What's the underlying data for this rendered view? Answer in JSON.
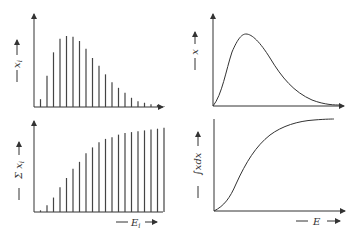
{
  "panels": {
    "top_left": {
      "ylabel": "x",
      "ylabel_sub": "i",
      "type": "discrete"
    },
    "bottom_left": {
      "ylabel": "Σ x",
      "ylabel_sub": "i",
      "xlabel": "E",
      "xlabel_sub": "i",
      "type": "discrete-cumulative"
    },
    "top_right": {
      "ylabel": "x",
      "type": "continuous"
    },
    "bottom_right": {
      "ylabel": "∫xdx",
      "xlabel": "E",
      "type": "continuous-cumulative"
    }
  },
  "chart_data": [
    {
      "type": "bar",
      "title": "",
      "ylabel": "x_i",
      "xlabel": "E_i",
      "categories": [
        1,
        2,
        3,
        4,
        5,
        6,
        7,
        8,
        9,
        10,
        11,
        12,
        13,
        14,
        15,
        16,
        17,
        18,
        19,
        20
      ],
      "values": [
        11,
        44,
        77,
        96,
        100,
        99,
        93,
        82,
        69,
        58,
        46,
        35,
        27,
        20,
        13,
        8,
        6,
        4,
        3,
        1
      ],
      "axes": "arrows, no ticks"
    },
    {
      "type": "bar",
      "title": "",
      "ylabel": "Σ x_i",
      "xlabel": "E_i",
      "categories": [
        1,
        2,
        3,
        4,
        5,
        6,
        7,
        8,
        9,
        10,
        11,
        12,
        13,
        14,
        15,
        16,
        17,
        18,
        19,
        20
      ],
      "values": [
        2,
        8,
        17,
        29,
        40,
        51,
        59,
        69,
        76,
        82,
        86,
        88,
        91,
        93,
        94,
        95,
        96,
        97,
        98,
        99
      ],
      "axes": "arrows, no ticks"
    },
    {
      "type": "line",
      "title": "",
      "ylabel": "x",
      "xlabel": "E",
      "x": [
        0,
        0.05,
        0.1,
        0.15,
        0.2,
        0.25,
        0.3,
        0.4,
        0.5,
        0.6,
        0.7,
        0.8,
        0.9,
        1.0
      ],
      "y": [
        0,
        35,
        75,
        96,
        100,
        95,
        85,
        62,
        40,
        24,
        13,
        6,
        3,
        1
      ],
      "axes": "arrows, no ticks"
    },
    {
      "type": "line",
      "title": "",
      "ylabel": "∫xdx",
      "xlabel": "E",
      "x": [
        0,
        0.1,
        0.2,
        0.3,
        0.4,
        0.5,
        0.6,
        0.7,
        0.8,
        0.9,
        1.0
      ],
      "y": [
        0,
        8,
        28,
        52,
        72,
        85,
        93,
        97,
        99,
        100,
        100
      ],
      "axes": "arrows, no ticks"
    }
  ]
}
